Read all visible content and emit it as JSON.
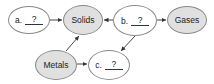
{
  "diagram": {
    "nodes": [
      {
        "id": "a",
        "prefix": "a.",
        "answer": "?",
        "filled": false
      },
      {
        "id": "solids",
        "label": "Solids",
        "filled": true
      },
      {
        "id": "b",
        "prefix": "b.",
        "answer": "?",
        "filled": false
      },
      {
        "id": "gases",
        "label": "Gases",
        "filled": true
      },
      {
        "id": "metals",
        "label": "Metals",
        "filled": true
      },
      {
        "id": "c",
        "prefix": "c.",
        "answer": "?",
        "filled": false
      }
    ],
    "edges": [
      {
        "from": "a",
        "to": "solids"
      },
      {
        "from": "b",
        "to": "solids"
      },
      {
        "from": "b",
        "to": "gases"
      },
      {
        "from": "b",
        "to": "c"
      },
      {
        "from": "metals",
        "to": "solids"
      },
      {
        "from": "metals",
        "to": "c"
      }
    ],
    "colors": {
      "filled": "#e0e0e0",
      "border": "#8a8a8a",
      "arrow": "#333333"
    }
  }
}
